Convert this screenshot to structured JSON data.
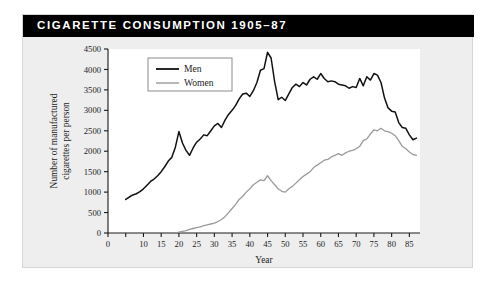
{
  "figure": {
    "title": "CIGARETTE CONSUMPTION 1905–87",
    "background_color": "#eeeeee",
    "title_bar_color": "#000000",
    "title_text_color": "#ffffff"
  },
  "chart_data": {
    "type": "line",
    "title": "CIGARETTE CONSUMPTION 1905–87",
    "xlabel": "Year",
    "ylabel": "Number of manufactured cigarettes per person",
    "xlim": [
      0,
      88
    ],
    "ylim": [
      0,
      4500
    ],
    "grid": false,
    "legend_position": "top-left",
    "x_ticks": [
      0,
      5,
      10,
      15,
      20,
      25,
      30,
      35,
      40,
      45,
      50,
      55,
      60,
      65,
      70,
      75,
      80,
      85
    ],
    "x_tick_labels": [
      "0",
      "",
      "10",
      "15",
      "20",
      "25",
      "30",
      "35",
      "40",
      "45",
      "50",
      "55",
      "60",
      "65",
      "70",
      "75",
      "80",
      "85"
    ],
    "y_ticks": [
      0,
      500,
      1000,
      1500,
      2000,
      2500,
      3000,
      3500,
      4000,
      4500
    ],
    "y_tick_labels": [
      "0",
      "500",
      "1000",
      "1500",
      "2000",
      "2500",
      "3000",
      "3500",
      "4000",
      "4500"
    ],
    "series": [
      {
        "name": "Men",
        "color": "#111111",
        "x": [
          5,
          6,
          7,
          8,
          9,
          10,
          11,
          12,
          13,
          14,
          15,
          16,
          17,
          18,
          19,
          20,
          21,
          22,
          23,
          24,
          25,
          26,
          27,
          28,
          29,
          30,
          31,
          32,
          33,
          34,
          35,
          36,
          37,
          38,
          39,
          40,
          41,
          42,
          43,
          44,
          45,
          46,
          47,
          48,
          49,
          50,
          51,
          52,
          53,
          54,
          55,
          56,
          57,
          58,
          59,
          60,
          61,
          62,
          63,
          64,
          65,
          66,
          67,
          68,
          69,
          70,
          71,
          72,
          73,
          74,
          75,
          76,
          77,
          78,
          79,
          80,
          81,
          82,
          83,
          84,
          85,
          86,
          87
        ],
        "values": [
          820,
          880,
          930,
          960,
          1010,
          1080,
          1170,
          1260,
          1320,
          1400,
          1500,
          1620,
          1760,
          1850,
          2100,
          2480,
          2200,
          2020,
          1900,
          2080,
          2220,
          2300,
          2400,
          2380,
          2500,
          2620,
          2680,
          2580,
          2760,
          2900,
          3000,
          3120,
          3280,
          3400,
          3420,
          3340,
          3480,
          3680,
          3980,
          4020,
          4420,
          4280,
          3700,
          3260,
          3320,
          3240,
          3400,
          3560,
          3640,
          3580,
          3680,
          3620,
          3760,
          3820,
          3760,
          3900,
          3780,
          3700,
          3720,
          3700,
          3640,
          3620,
          3600,
          3540,
          3580,
          3560,
          3780,
          3600,
          3820,
          3740,
          3900,
          3860,
          3680,
          3300,
          3060,
          2980,
          2960,
          2700,
          2580,
          2560,
          2400,
          2280,
          2320
        ],
        "peak_year": 45,
        "peak_value": 4420,
        "end_value": 2320
      },
      {
        "name": "Women",
        "color": "#9a9a9a",
        "x": [
          20,
          21,
          22,
          23,
          24,
          25,
          26,
          27,
          28,
          29,
          30,
          31,
          32,
          33,
          34,
          35,
          36,
          37,
          38,
          39,
          40,
          41,
          42,
          43,
          44,
          45,
          46,
          47,
          48,
          49,
          50,
          51,
          52,
          53,
          54,
          55,
          56,
          57,
          58,
          59,
          60,
          61,
          62,
          63,
          64,
          65,
          66,
          67,
          68,
          69,
          70,
          71,
          72,
          73,
          74,
          75,
          76,
          77,
          78,
          79,
          80,
          81,
          82,
          83,
          84,
          85,
          86,
          87
        ],
        "values": [
          20,
          40,
          60,
          90,
          110,
          130,
          150,
          180,
          200,
          220,
          240,
          280,
          330,
          400,
          500,
          600,
          700,
          820,
          900,
          1000,
          1080,
          1180,
          1240,
          1300,
          1280,
          1400,
          1280,
          1180,
          1080,
          1020,
          1000,
          1080,
          1140,
          1220,
          1300,
          1380,
          1440,
          1500,
          1600,
          1660,
          1720,
          1780,
          1800,
          1860,
          1900,
          1940,
          1900,
          1960,
          2000,
          2020,
          2060,
          2120,
          2260,
          2300,
          2420,
          2520,
          2500,
          2560,
          2500,
          2480,
          2440,
          2380,
          2260,
          2120,
          2060,
          1980,
          1920,
          1900
        ],
        "peak_year": 75,
        "peak_value": 2520,
        "end_value": 1900
      }
    ]
  },
  "legend": {
    "entries": [
      {
        "label": "Men",
        "color": "#111111"
      },
      {
        "label": "Women",
        "color": "#9a9a9a"
      }
    ]
  }
}
